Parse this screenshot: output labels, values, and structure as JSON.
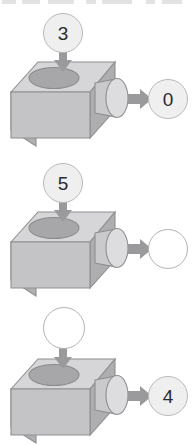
{
  "page": {
    "background_color": "#ffffff",
    "partial_text_row_at_top": true
  },
  "palette": {
    "box_top_face": "#d4d4d6",
    "box_front_face": "#c3c3c5",
    "box_side_face": "#adadaf",
    "hole_fill": "#a6a6a8",
    "spout_body": "#c9c9cb",
    "spout_face": "#dcdcde",
    "outline": "#8f8f91",
    "arrow_fill": "#9a9a9c",
    "token_filled_fill": "#efeff0",
    "token_filled_border": "#b9b9bb",
    "token_empty_fill": "#ffffff",
    "token_empty_border": "#b3b3b5",
    "number_text": "#2b2b2b"
  },
  "icons": {
    "down_arrow": "arrow-down-icon",
    "right_arrow": "arrow-right-icon",
    "machine_body": "function-machine-box-icon",
    "funnel_hole": "funnel-hole-icon",
    "output_spout": "output-spout-icon"
  },
  "machines": [
    {
      "id": "machine-1",
      "input": {
        "value": "3",
        "state": "filled"
      },
      "output": {
        "value": "0",
        "state": "filled"
      }
    },
    {
      "id": "machine-2",
      "input": {
        "value": "5",
        "state": "filled"
      },
      "output": {
        "value": "",
        "state": "empty"
      }
    },
    {
      "id": "machine-3",
      "input": {
        "value": "",
        "state": "empty"
      },
      "output": {
        "value": "4",
        "state": "filled"
      }
    }
  ]
}
